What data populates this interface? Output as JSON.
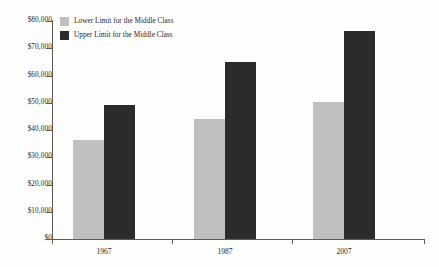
{
  "chart_data": {
    "type": "bar",
    "title": "",
    "subtitle": "",
    "xlabel": "",
    "ylabel": "",
    "categories": [
      "1967",
      "1987",
      "2007"
    ],
    "series": [
      {
        "name": "Lower Limit for the Middle Class",
        "color": "#c0c0c0",
        "values": [
          36500,
          49300,
          0
        ]
      },
      {
        "name": "Upper Limit for the Middle Class",
        "color": "#2b2b2b",
        "values": [
          0,
          0,
          0
        ]
      }
    ],
    "groups": [
      {
        "category": "1967",
        "lower": 36500,
        "upper": 49300
      },
      {
        "category": "1987",
        "lower": 44000,
        "upper": 65000
      },
      {
        "category": "2007",
        "lower": 50300,
        "upper": 76200
      }
    ],
    "ylim": [
      0,
      80000
    ],
    "ytick_values": [
      0,
      10000,
      20000,
      30000,
      40000,
      50000,
      60000,
      70000,
      80000
    ],
    "ytick_labels": [
      "$0",
      "$10,000",
      "$20,000",
      "$30,000",
      "$40,000",
      "$50,000",
      "$60,000",
      "$70,000",
      "$80,000"
    ],
    "grid": false,
    "legend_position": "top-left-inside",
    "legend": [
      {
        "label": "Lower Limit for the Middle Class",
        "color": "#c0c0c0"
      },
      {
        "label": "Upper Limit for the Middle Class",
        "color": "#2b2b2b"
      }
    ],
    "colors": {
      "lower": "#c0c0c0",
      "upper": "#2b2b2b",
      "axis": "#5a5a5a",
      "text": "#1f1f1f",
      "background": "#fdfdfc"
    }
  }
}
